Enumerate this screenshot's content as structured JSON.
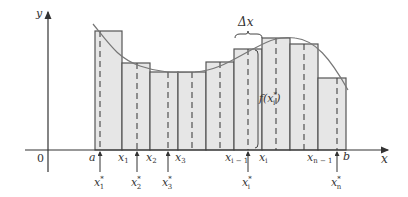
{
  "diagram": {
    "axes": {
      "x_label": "x",
      "y_label": "y",
      "origin_label": "0"
    },
    "colors": {
      "rect_fill": "#e6e6e6",
      "rect_stroke": "#555555",
      "curve": "#777777",
      "axis": "#333333",
      "dashed": "#444444"
    },
    "partition_labels": [
      {
        "id": "a",
        "text": "a",
        "sub": ""
      },
      {
        "id": "x1",
        "text": "x",
        "sub": "1"
      },
      {
        "id": "x2",
        "text": "x",
        "sub": "2"
      },
      {
        "id": "x3",
        "text": "x",
        "sub": "3"
      },
      {
        "id": "xim1",
        "text": "x",
        "sub": "i − 1"
      },
      {
        "id": "xi",
        "text": "x",
        "sub": "i"
      },
      {
        "id": "xnm1",
        "text": "x",
        "sub": "n − 1"
      },
      {
        "id": "b",
        "text": "b",
        "sub": ""
      }
    ],
    "sample_labels": [
      {
        "text": "x",
        "sup": "*",
        "sub": "1"
      },
      {
        "text": "x",
        "sup": "*",
        "sub": "2"
      },
      {
        "text": "x",
        "sup": "*",
        "sub": "3"
      },
      {
        "text": "x",
        "sup": "*",
        "sub": "i"
      },
      {
        "text": "x",
        "sup": "*",
        "sub": "n"
      }
    ],
    "delta_x_label": "Δx",
    "height_label": {
      "prefix": "f(x",
      "sup": "*",
      "sub": "i",
      "suffix": ")"
    },
    "rectangles": [
      {
        "x0": 95,
        "x1": 122,
        "top": 31,
        "sample_x": 100
      },
      {
        "x0": 122,
        "x1": 150,
        "top": 63,
        "sample_x": 137
      },
      {
        "x0": 150,
        "x1": 178,
        "top": 72,
        "sample_x": 168
      },
      {
        "x0": 178,
        "x1": 206,
        "top": 72,
        "sample_x": 192
      },
      {
        "x0": 206,
        "x1": 234,
        "top": 62,
        "sample_x": 220
      },
      {
        "x0": 234,
        "x1": 262,
        "top": 49,
        "sample_x": 248
      },
      {
        "x0": 262,
        "x1": 290,
        "top": 38,
        "sample_x": 276
      },
      {
        "x0": 290,
        "x1": 318,
        "top": 44,
        "sample_x": 304
      },
      {
        "x0": 318,
        "x1": 346,
        "top": 78,
        "sample_x": 337
      }
    ]
  }
}
